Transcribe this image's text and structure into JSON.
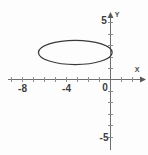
{
  "figure": {
    "background_color": "#fdfdfd",
    "axis_color": "#6e6e6e",
    "curve_color": "#3a3a3a",
    "label_color": "#3d3d3d"
  },
  "axes": {
    "x_axis_name": "X",
    "y_axis_name": "Y",
    "origin_label": "0",
    "x_tick_labels": [
      "-8",
      "-4",
      "0"
    ],
    "y_tick_labels": [
      "5",
      "-5"
    ],
    "x_label_positions": [
      -8,
      -4,
      0
    ],
    "y_label_positions": [
      5,
      -5
    ]
  },
  "chart_data": {
    "type": "line",
    "xlabel": "X",
    "ylabel": "Y",
    "xlim": [
      -9.3,
      2.6
    ],
    "ylim": [
      -5.8,
      5.6
    ],
    "xticks": [
      -9,
      -8,
      -7,
      -6,
      -5,
      -4,
      -3,
      -2,
      -1,
      0,
      1,
      2
    ],
    "yticks": [
      -5,
      -4,
      -3,
      -2,
      -1,
      0,
      1,
      2,
      3,
      4,
      5
    ],
    "xticklabels": [
      "",
      "-8",
      "",
      "",
      "",
      "-4",
      "",
      "",
      "",
      "0",
      "",
      ""
    ],
    "yticklabels": [
      "",
      "",
      "",
      "",
      "",
      "0",
      "",
      "",
      "",
      "",
      "5"
    ],
    "grid": false,
    "legend": null,
    "series": [
      {
        "name": "ellipse",
        "shape": "ellipse",
        "center": [
          -3.2,
          2.35
        ],
        "semi_axis_x": 3.35,
        "semi_axis_y": 1.05,
        "x_range": [
          -6.55,
          0.15
        ],
        "y_range": [
          1.3,
          3.4
        ],
        "closed": true,
        "color": "#3a3a3a",
        "linewidth": 1.25,
        "fill": "none",
        "equation": "(x + 3.2)^2 / 3.35^2 + (y - 2.35)^2 / 1.05^2 = 1"
      }
    ],
    "annotations": []
  }
}
